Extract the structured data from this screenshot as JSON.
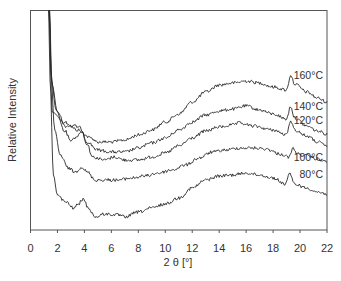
{
  "chart_data": {
    "type": "line",
    "title": "",
    "xlabel": "2 θ [°]",
    "ylabel": "Relative Intensity",
    "xlim": [
      0,
      22
    ],
    "xticks": [
      0,
      2,
      4,
      6,
      8,
      10,
      12,
      14,
      16,
      18,
      20,
      22
    ],
    "yticks": [],
    "grid": false,
    "legend": "inline labels at right end of each curve",
    "series": [
      {
        "name": "160°C",
        "label": "160°C",
        "points": [
          [
            1.35,
            250
          ],
          [
            1.6,
            118
          ],
          [
            2.5,
            108
          ],
          [
            3.5,
            100
          ],
          [
            4.5,
            92
          ],
          [
            5.0,
            88
          ],
          [
            6.0,
            88
          ],
          [
            7.0,
            90
          ],
          [
            8.0,
            95
          ],
          [
            9.0,
            100
          ],
          [
            10.0,
            108
          ],
          [
            11.0,
            116
          ],
          [
            12.0,
            128
          ],
          [
            13.0,
            138
          ],
          [
            14.0,
            145
          ],
          [
            15.0,
            147
          ],
          [
            16.0,
            149
          ],
          [
            17.0,
            147
          ],
          [
            18.0,
            143
          ],
          [
            19.0,
            140
          ],
          [
            19.3,
            155
          ],
          [
            19.6,
            146
          ],
          [
            20.5,
            138
          ],
          [
            21.3,
            132
          ],
          [
            22.0,
            128
          ]
        ]
      },
      {
        "name": "140°C",
        "label": "140°C",
        "points": [
          [
            1.35,
            250
          ],
          [
            1.6,
            145
          ],
          [
            2.0,
            118
          ],
          [
            2.6,
            104
          ],
          [
            3.3,
            104
          ],
          [
            3.7,
            102
          ],
          [
            4.2,
            88
          ],
          [
            5.0,
            80
          ],
          [
            6.0,
            78
          ],
          [
            7.0,
            78
          ],
          [
            8.0,
            82
          ],
          [
            9.0,
            87
          ],
          [
            10.0,
            92
          ],
          [
            11.0,
            100
          ],
          [
            12.0,
            108
          ],
          [
            13.0,
            115
          ],
          [
            14.0,
            119
          ],
          [
            15.0,
            121
          ],
          [
            16.0,
            124
          ],
          [
            17.0,
            120
          ],
          [
            18.0,
            116
          ],
          [
            19.0,
            111
          ],
          [
            19.3,
            124
          ],
          [
            19.6,
            112
          ],
          [
            20.5,
            104
          ],
          [
            21.3,
            99
          ],
          [
            22.0,
            96
          ]
        ]
      },
      {
        "name": "120°C",
        "label": "120°C",
        "points": [
          [
            1.35,
            250
          ],
          [
            1.55,
            150
          ],
          [
            1.9,
            120
          ],
          [
            2.5,
            100
          ],
          [
            3.0,
            90
          ],
          [
            3.5,
            94
          ],
          [
            3.8,
            99
          ],
          [
            4.2,
            86
          ],
          [
            4.6,
            73
          ],
          [
            5.5,
            70
          ],
          [
            6.2,
            73
          ],
          [
            7.0,
            70
          ],
          [
            8.0,
            70
          ],
          [
            9.0,
            73
          ],
          [
            10.0,
            77
          ],
          [
            11.0,
            84
          ],
          [
            12.0,
            92
          ],
          [
            13.0,
            99
          ],
          [
            14.0,
            103
          ],
          [
            15.0,
            105
          ],
          [
            15.5,
            107
          ],
          [
            16.5,
            104
          ],
          [
            18.0,
            100
          ],
          [
            19.0,
            95
          ],
          [
            19.3,
            110
          ],
          [
            19.6,
            100
          ],
          [
            20.5,
            94
          ],
          [
            21.3,
            88
          ],
          [
            22.0,
            84
          ]
        ]
      },
      {
        "name": "100°C",
        "label": "100°C",
        "points": [
          [
            1.35,
            250
          ],
          [
            1.5,
            160
          ],
          [
            1.8,
            100
          ],
          [
            2.2,
            75
          ],
          [
            2.8,
            62
          ],
          [
            3.3,
            58
          ],
          [
            3.8,
            63
          ],
          [
            4.2,
            58
          ],
          [
            4.8,
            50
          ],
          [
            5.5,
            50
          ],
          [
            6.5,
            50
          ],
          [
            7.5,
            52
          ],
          [
            8.5,
            54
          ],
          [
            9.5,
            57
          ],
          [
            10.5,
            60
          ],
          [
            11.5,
            65
          ],
          [
            12.5,
            72
          ],
          [
            13.5,
            78
          ],
          [
            14.5,
            80
          ],
          [
            15.5,
            82
          ],
          [
            16.5,
            82
          ],
          [
            17.5,
            81
          ],
          [
            18.5,
            76
          ],
          [
            19.2,
            73
          ],
          [
            19.5,
            82
          ],
          [
            19.8,
            76
          ],
          [
            20.5,
            74
          ],
          [
            21.3,
            71
          ],
          [
            22.0,
            68
          ]
        ]
      },
      {
        "name": "80°C",
        "label": "80°C",
        "points": [
          [
            1.35,
            250
          ],
          [
            1.45,
            150
          ],
          [
            1.7,
            55
          ],
          [
            2.0,
            35
          ],
          [
            2.6,
            28
          ],
          [
            3.2,
            22
          ],
          [
            3.5,
            25
          ],
          [
            3.9,
            31
          ],
          [
            4.3,
            22
          ],
          [
            4.8,
            13
          ],
          [
            5.5,
            16
          ],
          [
            6.5,
            15
          ],
          [
            7.0,
            13
          ],
          [
            8.0,
            18
          ],
          [
            9.0,
            22
          ],
          [
            10.0,
            26
          ],
          [
            11.0,
            32
          ],
          [
            12.0,
            42
          ],
          [
            13.0,
            50
          ],
          [
            14.0,
            54
          ],
          [
            15.0,
            55
          ],
          [
            16.0,
            57
          ],
          [
            17.0,
            55
          ],
          [
            18.0,
            52
          ],
          [
            18.9,
            46
          ],
          [
            19.2,
            56
          ],
          [
            19.6,
            46
          ],
          [
            20.5,
            42
          ],
          [
            21.3,
            38
          ],
          [
            22.0,
            36
          ]
        ]
      }
    ]
  },
  "labels": {
    "xlabel": "2 θ [°]",
    "ylabel": "Relative Intensity",
    "series": [
      "160°C",
      "140°C",
      "120°C",
      "100°C",
      "80°C"
    ],
    "xticks": [
      "0",
      "2",
      "4",
      "6",
      "8",
      "10",
      "12",
      "14",
      "16",
      "18",
      "20",
      "22"
    ]
  }
}
